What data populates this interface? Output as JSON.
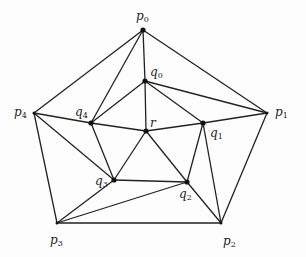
{
  "diagram": {
    "type": "planar-triangulation",
    "stroke_color": "#222222",
    "vertex_color": "#111111",
    "vertices": [
      {
        "id": "p0",
        "name": "p",
        "sub": "0",
        "x": 143,
        "y": 30,
        "lx": 136,
        "ly": 10
      },
      {
        "id": "p1",
        "name": "p",
        "sub": "1",
        "x": 267,
        "y": 113,
        "lx": 275,
        "ly": 106
      },
      {
        "id": "p2",
        "name": "p",
        "sub": "2",
        "x": 221,
        "y": 223,
        "lx": 223,
        "ly": 235
      },
      {
        "id": "p3",
        "name": "p",
        "sub": "3",
        "x": 57,
        "y": 223,
        "lx": 50,
        "ly": 234
      },
      {
        "id": "p4",
        "name": "p",
        "sub": "4",
        "x": 34,
        "y": 113,
        "lx": 14,
        "ly": 106
      },
      {
        "id": "q0",
        "name": "q",
        "sub": "0",
        "x": 145,
        "y": 81,
        "lx": 150,
        "ly": 66
      },
      {
        "id": "q1",
        "name": "q",
        "sub": "1",
        "x": 203,
        "y": 123,
        "lx": 210,
        "ly": 127
      },
      {
        "id": "q2",
        "name": "q",
        "sub": "2",
        "x": 187,
        "y": 182,
        "lx": 179,
        "ly": 188
      },
      {
        "id": "q3",
        "name": "q",
        "sub": "3",
        "x": 114,
        "y": 180,
        "lx": 95,
        "ly": 175
      },
      {
        "id": "q4",
        "name": "q",
        "sub": "4",
        "x": 91,
        "y": 123,
        "lx": 75,
        "ly": 106
      },
      {
        "id": "r",
        "name": "r",
        "sub": "",
        "x": 146,
        "y": 131,
        "lx": 150,
        "ly": 117
      }
    ],
    "edges": [
      [
        "p0",
        "p1"
      ],
      [
        "p1",
        "p2"
      ],
      [
        "p2",
        "p3"
      ],
      [
        "p3",
        "p4"
      ],
      [
        "p4",
        "p0"
      ],
      [
        "p0",
        "q0"
      ],
      [
        "p0",
        "q4"
      ],
      [
        "q0",
        "q4"
      ],
      [
        "q0",
        "q1"
      ],
      [
        "q0",
        "r"
      ],
      [
        "q0",
        "p1"
      ],
      [
        "q1",
        "p1"
      ],
      [
        "q1",
        "r"
      ],
      [
        "q1",
        "q2"
      ],
      [
        "q1",
        "p2"
      ],
      [
        "r",
        "q4"
      ],
      [
        "r",
        "q3"
      ],
      [
        "r",
        "q2"
      ],
      [
        "q4",
        "p4"
      ],
      [
        "q4",
        "q3"
      ],
      [
        "p4",
        "q3"
      ],
      [
        "q3",
        "p3"
      ],
      [
        "q3",
        "q2"
      ],
      [
        "p3",
        "q2"
      ],
      [
        "q2",
        "p2"
      ]
    ]
  }
}
